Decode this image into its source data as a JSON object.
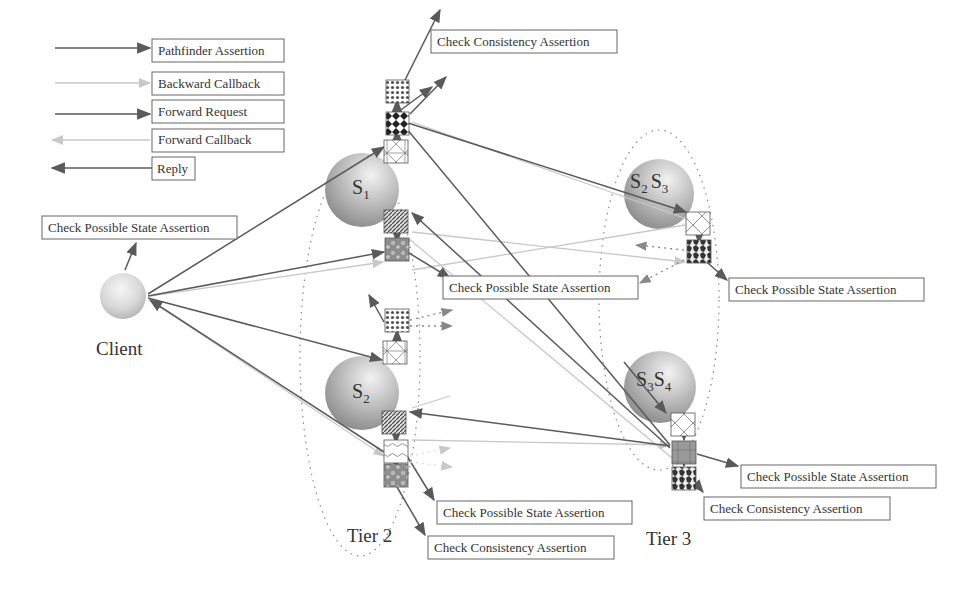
{
  "legend": [
    {
      "label": "Pathfinder Assertion",
      "style": "solid-dark",
      "direction": "right"
    },
    {
      "label": "Backward Callback",
      "style": "faint",
      "direction": "right"
    },
    {
      "label": "Forward Request",
      "style": "solid-dark",
      "direction": "right"
    },
    {
      "label": "Forward Callback",
      "style": "faint",
      "direction": "left"
    },
    {
      "label": "Reply",
      "style": "solid-dark",
      "direction": "left"
    }
  ],
  "nodes": {
    "client": {
      "label": "Client"
    },
    "s1": {
      "main": "S",
      "sub": "1"
    },
    "s2": {
      "main": "S",
      "sub": "2"
    },
    "s2s3": {
      "a": "S",
      "a_sub": "2",
      "b": "S",
      "b_sub": "3"
    },
    "s3s4": {
      "a": "S",
      "a_sub": "3",
      "b": "S",
      "b_sub": "4"
    }
  },
  "tiers": {
    "tier2": "Tier 2",
    "tier3": "Tier 3"
  },
  "assertion_boxes": {
    "client_possible_state": "Check Possible State Assertion",
    "s1_consistency": "Check Consistency Assertion",
    "s1_possible_state": "Check Possible State Assertion",
    "s2s3_possible_state": "Check Possible State Assertion",
    "s2_possible_state": "Check Possible State Assertion",
    "s2_consistency": "Check Consistency Assertion",
    "s3s4_possible_state": "Check Possible State Assertion",
    "s3s4_consistency": "Check Consistency Assertion"
  },
  "colors": {
    "dark_arrow": "#5a5a5a",
    "faint_arrow": "#c8c8c8",
    "box_border": "#666666",
    "text": "#333333"
  }
}
